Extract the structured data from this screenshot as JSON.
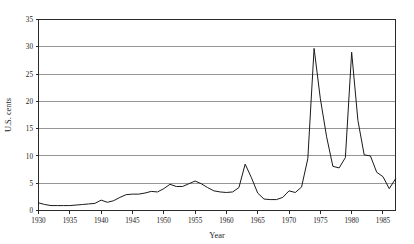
{
  "chart_data": {
    "type": "line",
    "title": "",
    "xlabel": "Year",
    "ylabel": "U.S. cents",
    "xlim": [
      1930,
      1987
    ],
    "ylim": [
      0,
      35
    ],
    "xticks": [
      1930,
      1935,
      1940,
      1945,
      1950,
      1955,
      1960,
      1965,
      1970,
      1975,
      1980,
      1985
    ],
    "yticks": [
      0,
      5,
      10,
      15,
      20,
      25,
      30,
      35
    ],
    "grid": "horizontal",
    "legend": "none",
    "series": [
      {
        "name": "U.S. cents",
        "x": [
          1930,
          1931,
          1932,
          1933,
          1934,
          1935,
          1936,
          1937,
          1938,
          1939,
          1940,
          1941,
          1942,
          1943,
          1944,
          1945,
          1946,
          1947,
          1948,
          1949,
          1950,
          1951,
          1952,
          1953,
          1954,
          1955,
          1956,
          1957,
          1958,
          1959,
          1960,
          1961,
          1962,
          1963,
          1964,
          1965,
          1966,
          1967,
          1968,
          1969,
          1970,
          1971,
          1972,
          1973,
          1974,
          1975,
          1976,
          1977,
          1978,
          1979,
          1980,
          1981,
          1982,
          1983,
          1984,
          1985,
          1986,
          1987
        ],
        "values": [
          1.4,
          1.1,
          0.9,
          0.9,
          0.9,
          0.9,
          1.0,
          1.1,
          1.2,
          1.3,
          1.9,
          1.5,
          1.8,
          2.4,
          2.9,
          3.0,
          3.0,
          3.2,
          3.5,
          3.4,
          4.0,
          4.8,
          4.4,
          4.4,
          4.9,
          5.4,
          4.9,
          4.2,
          3.6,
          3.4,
          3.3,
          3.4,
          4.2,
          8.5,
          6.0,
          3.2,
          2.1,
          2.0,
          2.0,
          2.4,
          3.6,
          3.3,
          4.3,
          9.5,
          29.7,
          20.5,
          13.5,
          8.1,
          7.8,
          9.7,
          29.0,
          16.5,
          10.2,
          10.0,
          7.0,
          6.2,
          4.0,
          5.8
        ]
      }
    ]
  },
  "axis": {
    "y_label": "U.S. cents",
    "x_label": "Year",
    "y_tick_labels": [
      "0",
      "5",
      "10",
      "15",
      "20",
      "25",
      "30",
      "35"
    ],
    "x_tick_labels": [
      "1930",
      "1935",
      "1940",
      "1945",
      "1950",
      "1955",
      "1960",
      "1965",
      "1970",
      "1975",
      "1980",
      "1985"
    ]
  },
  "style": {
    "line_color": "#1a1a1a",
    "grid_color": "#8a8a8a",
    "axis_color": "#2a2a2a",
    "background": "#ffffff"
  }
}
